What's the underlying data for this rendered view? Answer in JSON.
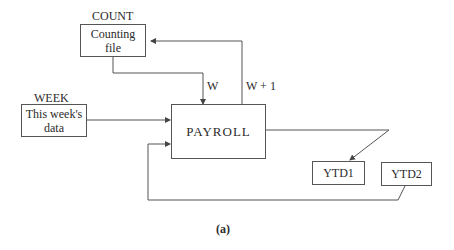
{
  "diagram": {
    "nodes": {
      "count": {
        "name": "COUNT",
        "text_line1": "Counting",
        "text_line2": "file"
      },
      "week": {
        "name": "WEEK",
        "text_line1": "This week's",
        "text_line2": "data"
      },
      "payroll": {
        "text": "PAYROLL"
      },
      "ytd1": {
        "text": "YTD1"
      },
      "ytd2": {
        "text": "YTD2"
      }
    },
    "edges": [
      {
        "from": "count",
        "to": "payroll",
        "label": "W"
      },
      {
        "from": "payroll",
        "to": "count",
        "label": "W + 1"
      },
      {
        "from": "week",
        "to": "payroll",
        "label": ""
      },
      {
        "from": "payroll",
        "to": "ytd1",
        "label": ""
      },
      {
        "from": "ytd2",
        "to": "payroll",
        "label": ""
      }
    ],
    "caption": "(a)"
  }
}
